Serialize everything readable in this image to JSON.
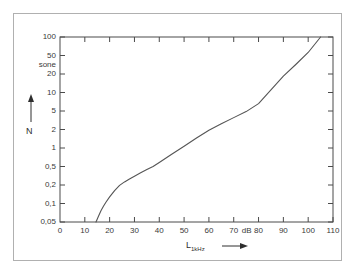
{
  "chart_data": {
    "type": "line",
    "title": "",
    "xlabel": "L",
    "xlabel_subscript": "1kHz",
    "xunit": "dB",
    "ylabel": "N",
    "yunit": "sone",
    "xlim": [
      0,
      110
    ],
    "ylim": [
      0.05,
      100
    ],
    "yscale": "log",
    "xscale": "linear",
    "grid": false,
    "legend": null,
    "xticks": [
      0,
      10,
      20,
      30,
      40,
      50,
      60,
      70,
      80,
      90,
      100,
      110
    ],
    "xtick_labels": [
      "0",
      "10",
      "20",
      "30",
      "40",
      "50",
      "60",
      "70",
      "80",
      "90",
      "100",
      "110"
    ],
    "yticks": [
      0.05,
      0.1,
      0.2,
      0.5,
      1,
      2,
      5,
      10,
      20,
      50,
      100
    ],
    "ytick_labels": [
      "0,05",
      "0,1",
      "0,2",
      "0,5",
      "1",
      "2",
      "5",
      "10",
      "20",
      "50",
      "100"
    ],
    "series": [
      {
        "name": "loudness function",
        "x": [
          14.5,
          15.5,
          16.5,
          17.5,
          18.5,
          20,
          22,
          24,
          26,
          28,
          30,
          32.5,
          35,
          37.5,
          40,
          45,
          50,
          55,
          60,
          65,
          70,
          75,
          80,
          85,
          90,
          95,
          100,
          105
        ],
        "y": [
          0.05,
          0.062,
          0.076,
          0.09,
          0.105,
          0.128,
          0.162,
          0.197,
          0.233,
          0.27,
          0.31,
          0.365,
          0.43,
          0.5,
          0.58,
          0.79,
          1.07,
          1.45,
          1.95,
          2.65,
          3.6,
          4.85,
          6.6,
          11.0,
          18.5,
          32.0,
          56.0,
          100.0
        ]
      }
    ]
  },
  "axis_labels": {
    "y_title": "N",
    "x_title_main": "L",
    "x_title_sub": "1kHz",
    "y_unit": "sone",
    "x_unit": "dB"
  },
  "icons": {
    "y_arrow": "up-arrow-icon",
    "x_arrow": "right-arrow-icon"
  },
  "colors": {
    "curve": "#555555",
    "axis": "#4a4a4a",
    "text": "#3a3a3a",
    "outer_frame": "#b0b0b0",
    "background": "#ffffff"
  }
}
